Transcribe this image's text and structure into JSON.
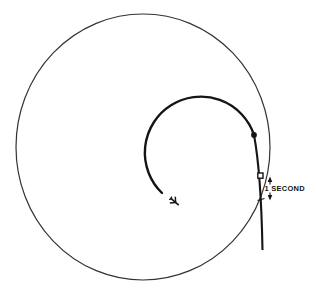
{
  "figure": {
    "background_color": "#ffffff",
    "thin_line_color": "#333333",
    "bold_line_color": "#151515"
  },
  "annotation": {
    "label": "1 SECOND"
  },
  "icons": {
    "airplane": "airplane-icon",
    "arrow_up": "arrow-up-icon",
    "arrow_down": "arrow-down-icon"
  },
  "markers": {
    "junction_dot": "filled-circle",
    "interval_square": "open-square",
    "interval_tick": "tick-mark"
  }
}
